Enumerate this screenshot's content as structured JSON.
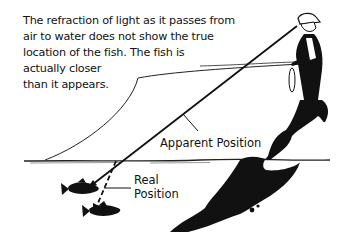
{
  "caption": {
    "lines": [
      "The refraction of light as it passes from",
      "air to water does not show the true",
      "location of the fish. The fish is",
      "actually closer",
      "than it appears."
    ]
  },
  "labels": {
    "apparent_position": "Apparent Position",
    "real_position_line1": "Real",
    "real_position_line2": "Position"
  },
  "colors": {
    "ink": "#111111",
    "background": "#ffffff"
  }
}
